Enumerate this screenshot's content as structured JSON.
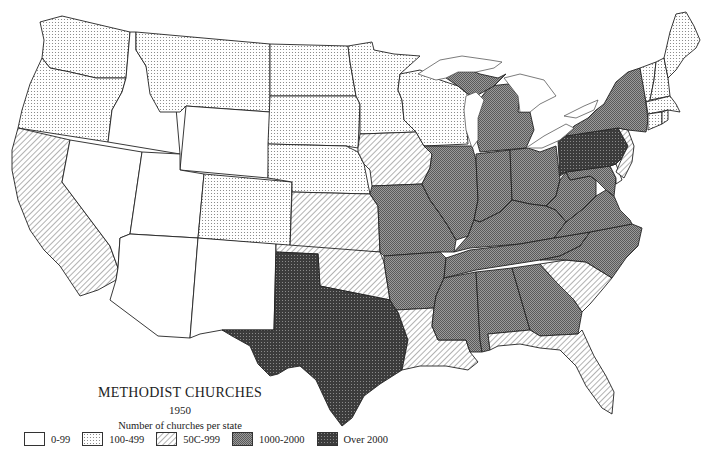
{
  "map": {
    "title": "METHODIST CHURCHES",
    "year": "1950",
    "subtitle": "Number of churches per state",
    "region": "Contiguous United States",
    "legend": [
      {
        "key": "c0",
        "label": "0-99",
        "pattern": "blank",
        "color": "#ffffff"
      },
      {
        "key": "c1",
        "label": "100-499",
        "pattern": "dots",
        "color": "#e6e6e6"
      },
      {
        "key": "c2",
        "label": "500-999",
        "pattern": "diagonal-hatch",
        "color": "#d0d0d0"
      },
      {
        "key": "c3",
        "label": "1000-2000",
        "pattern": "fine-crosshatch",
        "color": "#8a8a8a"
      },
      {
        "key": "c4",
        "label": "Over 2000",
        "pattern": "dark-grid",
        "color": "#444444"
      }
    ],
    "legend_labels_display": [
      "0-99",
      "100-499",
      "50C-999",
      "1000-2000",
      "Over 2000"
    ],
    "states": {
      "WA": "c1",
      "OR": "c1",
      "CA": "c2",
      "ID": "c0",
      "NV": "c0",
      "MT": "c1",
      "WY": "c0",
      "UT": "c0",
      "AZ": "c0",
      "CO": "c1",
      "NM": "c0",
      "ND": "c1",
      "SD": "c1",
      "NE": "c1",
      "KS": "c2",
      "OK": "c2",
      "TX": "c4",
      "MN": "c1",
      "IA": "c2",
      "MO": "c3",
      "AR": "c3",
      "LA": "c2",
      "WI": "c1",
      "IL": "c3",
      "MI": "c3",
      "IN": "c3",
      "OH": "c3",
      "KY": "c3",
      "TN": "c3",
      "MS": "c3",
      "AL": "c3",
      "GA": "c3",
      "FL": "c2",
      "SC": "c2",
      "NC": "c3",
      "VA": "c3",
      "WV": "c3",
      "MD": "c3",
      "DE": "c0",
      "PA": "c4",
      "NJ": "c2",
      "NY": "c3",
      "VT": "c1",
      "NH": "c1",
      "ME": "c1",
      "MA": "c1",
      "CT": "c1",
      "RI": "c1"
    }
  }
}
